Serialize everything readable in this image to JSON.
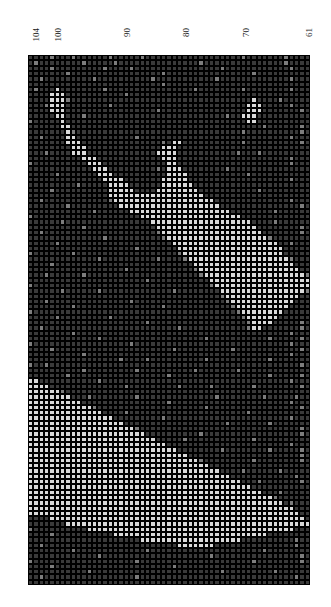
{
  "page": {
    "background_color": "#ffffff",
    "width": 331,
    "height": 607
  },
  "chart_title": "LEOPARD PRINT PILLOW",
  "axis": {
    "orientation": "top",
    "tick_labels": [
      "104",
      "100",
      "90",
      "80",
      "70",
      "61"
    ],
    "tick_positions_px": [
      36,
      58,
      127,
      186,
      246,
      309
    ],
    "label_rotation_deg": -90,
    "range": [
      61,
      104
    ]
  },
  "chart_data": {
    "type": "heatmap",
    "title": "LEOPARD PRINT PILLOW",
    "subtitle": "",
    "xlabel": "",
    "ylabel": "",
    "grid": true,
    "legend_position": "none",
    "orientation": "rotated-90",
    "rows": 100,
    "cols": 53,
    "cell_width_px": 5.32,
    "cell_height_px": 5.3,
    "gridline_color": "#000000",
    "value_labels": [
      "light",
      "mid",
      "dark"
    ],
    "palette": {
      "light": "#d9d9d9",
      "mid": "#7d7d7d",
      "dark": "#3a3a3a"
    },
    "x": [
      104,
      103,
      102,
      101,
      100,
      99,
      98,
      97,
      96,
      95,
      94,
      93,
      92,
      91,
      90,
      89,
      88,
      87,
      86,
      85,
      84,
      83,
      82,
      81,
      80,
      79,
      78,
      77,
      76,
      75,
      74,
      73,
      72,
      71,
      70,
      69,
      68,
      67,
      66,
      65,
      64,
      63,
      62,
      61
    ],
    "xlim": [
      104,
      61
    ],
    "ylim": [
      0,
      100
    ],
    "encoding": "rows of 53 characters; l=light, m=mid, d=dark",
    "cells": [
      "ddddmdddmddddddmdddddmddddddddddddddddddmdddddddmdddd",
      "dmddddddddmdddddmdddddddddddddddmdddddddddddddddmdddd",
      "ddddmdddddddddmddddmddddddddddddddddmddddddddddddmddd",
      "dddddddmdddddddddddddddddmddddddddddddddddmdddddddddd",
      "ddmdddddddddmddddddddddmdddddddddddmdddddddddddddmddd",
      "dddddddddddddddddddddddddmddddddddddddddddddddddddddd",
      "dmdddlddddddddmddddddddddddddddmddddddddmddddddddmddd",
      "ddddllldddddddddddmdddddddddddddddddddddddddddddddddd",
      "ddddlllmddddddddddddddddddddddddddddddddddlddddmddddd",
      "dddmlllddddddddmdddddddddddddddddddddddddllldddddmddd",
      "ddddllldddddddddddddddddmddddddddddddddddllldddddddmd",
      "dddddlldddmddddddddddddddddddddddddddmddllldddddddddd",
      "mdddddlddddddddddddddddddddddddddddddddddlldddddddddd",
      "ddddddllddddddddddddddddddddddddddddddddddddmddddddmd",
      "dddddddlmdddddddddddddddddddddddddddddddmddddddddddmd",
      "ddmddddlldddddddddddmddddddddddddddddddddddddddddmddd",
      "dddddddllldddddddddddddddmdlldddddddddddmddddddddddmd",
      "ddddddddlllddddddddddddddlllddddddddddddddddddddddddd",
      "dddmddddllldddddddddddddlllldddddddddddmdddmddddddddd",
      "ddddddddddlllddddddddddddllldddddddddddddddddddddmddd",
      "mddddddddddlllddddddddddddlldddddddddddddddddddddmddd",
      "ddddddddddddllldddddddddmdlllddddddddmddddddddddddddd",
      "dddddmdddddddlllddddddddddlllldddddddddddmddddddddddd",
      "ddddddddddddddlllldddddddllllldddddddddddddddddddmddd",
      "dddddddddmdddddllllddddddlllllldddddddddddddddddddddd",
      "ddddmddddddddddlllllddddlllllllldddddddddddmddddddddd",
      "dddddddddddddddlllllllllllllllllldddddddddddddddddddd",
      "ddmddddddddddddmlllllllllllllllllllddddddddddddddmddd",
      "dddddddmdddddddddllllllllllllllllllldddddddddddddddmd",
      "ddddddddddddmddddddlllllllllllllllllllddddddddmdddddd",
      "mddddddddddddddddddddlllllllllllllllllllddddddddddddd",
      "ddddddmddddddddddddddddlllllllllllllllllllddddmdddddd",
      "ddddddddddmdddddddddddddlllllllllllllllllllddddddddmd",
      "ddmdddddddddddddddddddddmllllllllllllllllllldddddddmd",
      "ddddddddddddddmddddddddddmlllllllllllllllllllmddddddd",
      "dddddmdddddddddddddddddddddllllllllllllllllllllddmddd",
      "ddddddddddddddddddddmdddddddllllllllllllllllllllddddd",
      "mdddddddmdddddddddddddddddddmlllllllllllllllllllddddd",
      "dddddddddddddmddddddddddmddddmlllllllllllllllllllmddd",
      "ddddmddddddddddddddddddddddddddlllllllllllllllllllddd",
      "ddddddddddddddddddmddddddddddddmllllllllllllllllllldd",
      "dddmddddddmdddddddddddddddddddddmlllllllllllllllllllm",
      "ddddddddddddddddddddddmdddddddddddlllllllllllllllllll",
      "mdddddddddddddddddddddddddddddddddmllllllllllllllllll",
      "ddddddmddddddmdddddddddddddmddddddddllllllllllllllllm",
      "ddddddddddddddddddddddddddddddddddddmlllllllllllllldd",
      "dddmdddddddddddddddmdddddddddddddddddmllllllllllllddd",
      "ddddddddmddddddddddddddddmddddddddddddmlllllllllldddd",
      "mddddddddddddddddddddddddddddddddddddddmllllllllddddd",
      "dddddmdddddddddmddddddddddddddddddddddddmlllllldddddd",
      "ddddddddddddddddddddddmddddddddddddddddddmlllldddddmd",
      "ddmdddddddddddddddddddddddddmddddddddddddmlldddddddmd",
      "ddddddddmddddddddddddddddddddddddddddddddddddddddmddd",
      "dddddddddddddmdddddddddddddddddddmdddddddddddmdddddmd",
      "mddddddddddddddddddmdddddddddddddddddddddddddddddmddd",
      "ddddmddddddddddddddddddddddmddddddddddmddddddddddddmd",
      "ddddddddddmddddddddddddddddddddddddddddddddddddddmddd",
      "dddddddddddddddddmddddmddddddddddmdddddddddddmddddddd",
      "mddmdddddddddddddddddddddddddddddddddddddddddddddddmd",
      "ddddddddddmdddddddddmddddddddddmdddddddmddddddddddddd",
      "dddddddmddddddddddddddddddmddddddddddddddddddmdddddmd",
      "lldddddddddddmdddddddddddddddddddddddddddddddddddmddd",
      "llllddddddddddddddmdddddddddmdddddmdddddddmddddddddmd",
      "llllllmdddddddddddddddddddddddddddddddddddddddddddddd",
      "lllllllldddmddddddddmddddddddddddddmddddddddmdddddmdd",
      "llllllllllddddddddddddddddmddddddddddddddddddddddmddd",
      "llllllllllllmddddddddddddddddddddmdddddddddddddddddmd",
      "llllllllllllllddddmddddddddddddddddddddddmddddddddddd",
      "lllllllllllllllldddddddddmdddddddddddddddddddddddmddd",
      "lllllllllllllllllldddddddddddddddddddmdddddddmddddddd",
      "llllllllllllllllllllmddddddddddddddddddddddddddddddmd",
      "llllllllllllllllllllllddddddddddmddddddddddddddddddmd",
      "lllllllllllllllllllllllldddddmddddddddddddmdddddddddd",
      "lllllllllllllllllllllllllldddddddddddddddddddddddmddd",
      "llllllllllllllllllllllllllllddddddddmddddddddmdddddmd",
      "lllllllllllllllllllllllllllllldddddddddddddddddddddmd",
      "llllllllllllllllllllllllllllllllmdddddddddmddddddddmd",
      "llllllllllllllllllllllllllllllllllddddddddddddddddddd",
      "llllllllllllllllllllllllllllllllllllddddmddddddmddddd",
      "llllllllllllllllllllllllllllllllllllllddddddddddddmdd",
      "lllllllllllllllllllllllllllllllllllllllldddmdddddddmd",
      "llllllllllllllllllllllllllllllllllllllllllddddddddddd",
      "lllllllllllllllllllllllllllllllllllllllllllldddmddddd",
      "llllllllllllllllllllllllllllllllllllllllllllllmdddddd",
      "lllllllllllllllllllllllllllllllllllllllllllllllldmddd",
      "llllllllllllllllllllllllllllllllllllllllllllllllllddd",
      "llllllllllllllllllllllllllllllllllllllllllllllllllldd",
      "ddddlllllllllllllllllllllllllllllllllllllllllllllllld",
      "dddddddllllllllllllllllllllllllllllllllllllllllllllll",
      "mddddddddddlllllllllllllllllllllllllllllllllllllllddd",
      "ddddmdddddddddddllllllllllllllllllllllllllllldddddddd",
      "dddddddddddddddddddddlllllllllllllllllllddddddddddmdd",
      "ddmdddddddddddddddddddddddddllllllldddddddddddddddmdd",
      "ddddddddmdddddddddddddmdddddddddddddddddddddmdddddddd",
      "dddddddddddddmddddddddddddddddddddmddddddddddddddddmd",
      "mdddddddddddddddddddmdddddddddddddddddddddmddddddddmd",
      "ddddmddddddddddddddddddddddmddddddddddddddddddddddddd",
      "dddddddddddmddddddddddddddddddddddddmdddddddddmdddddd",
      "ddmdddddddddddddddddmdddddddddddddddddddddddddddddmdd",
      "ddddddddddddddddddddddddddddddddddddddddddddddddddddd"
    ]
  }
}
